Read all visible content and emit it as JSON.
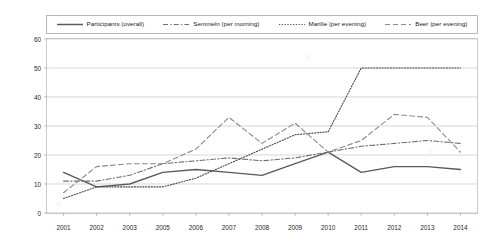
{
  "chart_data": {
    "type": "line",
    "title": "",
    "xlabel": "",
    "ylabel": "",
    "grid": true,
    "legend_position": "top",
    "categories": [
      "2001",
      "2002",
      "2003",
      "2005",
      "2006",
      "2007",
      "2008",
      "2009",
      "2010",
      "2011",
      "2012",
      "2013",
      "2014"
    ],
    "ylim": [
      0,
      60
    ],
    "yticks": [
      "0",
      "10",
      "20",
      "30",
      "40",
      "50",
      "60"
    ],
    "series": [
      {
        "name": "Participants (overall)",
        "style": "solid",
        "color": "#5a5a5a",
        "values": [
          14,
          9,
          10,
          14,
          15,
          14,
          13,
          17,
          21,
          14,
          16,
          16,
          15
        ]
      },
      {
        "name": "Semmeln (per morning)",
        "style": "dash-dot",
        "color": "#707070",
        "values": [
          11,
          11,
          13,
          17,
          18,
          19,
          18,
          19,
          21,
          23,
          24,
          25,
          24
        ]
      },
      {
        "name": "Marille (per evening)",
        "style": "dotted",
        "color": "#4a4a4a",
        "values": [
          5,
          9,
          9,
          9,
          12,
          17,
          22,
          27,
          28,
          50,
          50,
          50,
          50
        ]
      },
      {
        "name": "Beer (per evening)",
        "style": "dashed",
        "color": "#8a8a8a",
        "values": [
          7,
          16,
          17,
          17,
          22,
          33,
          24,
          31,
          21,
          25,
          34,
          33,
          21
        ]
      }
    ]
  }
}
